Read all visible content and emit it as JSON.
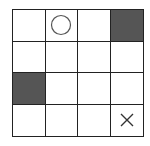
{
  "board": {
    "rows": 4,
    "cols": 4,
    "cells": [
      [
        "",
        "circle",
        "",
        "filled"
      ],
      [
        "",
        "",
        "",
        ""
      ],
      [
        "filled",
        "",
        "",
        ""
      ],
      [
        "",
        "",
        "",
        "cross"
      ]
    ]
  },
  "colors": {
    "grid_line": "#222222",
    "filled": "#555555",
    "background": "#ffffff",
    "mark": "#333333"
  }
}
